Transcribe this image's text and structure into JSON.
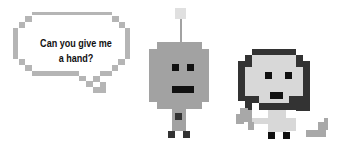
{
  "speech_bubble": {
    "line1": "Can you give me",
    "line2": "a hand?"
  },
  "characters": [
    {
      "name": "robot",
      "color": "#9e9e9e"
    },
    {
      "name": "girl",
      "face_color": "#d6d6d6",
      "hair_color": "#333333"
    }
  ],
  "colors": {
    "outline": "#b5b5b5",
    "robot_body": "#a2a2a2",
    "antenna_box": "#e0e0e0",
    "dark": "#111111",
    "hair": "#333333",
    "face": "#d8d8d8",
    "arm": "#a8a8a8"
  }
}
